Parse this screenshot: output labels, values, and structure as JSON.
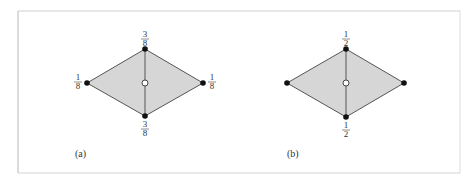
{
  "colors": {
    "fill": "#d6d6d6",
    "edge": "#555555",
    "node": "#111111",
    "center_node_fill": "#ffffff",
    "frame": "#cccccc"
  },
  "panels": [
    {
      "label": "(a)",
      "vertices": {
        "top": {
          "weight_num": "3",
          "weight_den": "8"
        },
        "left": {
          "weight_num": "1",
          "weight_den": "8"
        },
        "right": {
          "weight_num": "1",
          "weight_den": "8"
        },
        "bottom": {
          "weight_num": "3",
          "weight_den": "8"
        }
      }
    },
    {
      "label": "(b)",
      "vertices": {
        "top": {
          "weight_num": "1",
          "weight_den": "2"
        },
        "bottom": {
          "weight_num": "1",
          "weight_den": "2"
        }
      }
    }
  ]
}
